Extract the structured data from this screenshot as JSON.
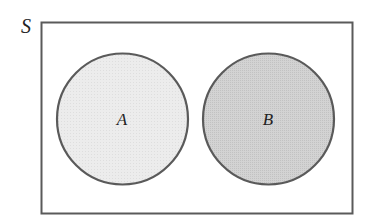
{
  "diagram": {
    "type": "venn",
    "universe_label": "S",
    "sets": [
      {
        "label": "A",
        "fill": "#ebebeb",
        "relation": "disjoint"
      },
      {
        "label": "B",
        "fill": "#cfcfcf",
        "relation": "disjoint"
      }
    ],
    "colors": {
      "stroke": "#5a5a5a",
      "background": "#ffffff",
      "text": "#222222"
    }
  }
}
